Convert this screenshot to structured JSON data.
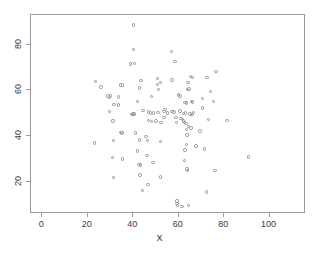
{
  "chart_data": {
    "type": "scatter",
    "title": "",
    "xlabel": "X",
    "ylabel": "",
    "xlim": [
      -5,
      116
    ],
    "ylim": [
      6,
      93
    ],
    "grid": false,
    "legend": null,
    "marker": {
      "shape": "open-circle",
      "color": "#8e8e94",
      "size": 3
    },
    "xticks": [
      0,
      20,
      40,
      60,
      80,
      100
    ],
    "yticks": [
      20,
      40,
      60,
      80
    ],
    "xtick_labels": [
      "0",
      "20",
      "40",
      "60",
      "80",
      "100"
    ],
    "ytick_labels": [
      "20",
      "40",
      "60",
      "80"
    ],
    "n_points": 118,
    "points": [
      [
        40.2,
        88.6
      ],
      [
        40.0,
        78.0
      ],
      [
        56.8,
        77.0
      ],
      [
        58.4,
        72.8
      ],
      [
        38.8,
        71.6
      ],
      [
        40.6,
        71.8
      ],
      [
        76.4,
        68.4
      ],
      [
        23.4,
        63.8
      ],
      [
        43.4,
        64.4
      ],
      [
        50.6,
        65.2
      ],
      [
        57.0,
        64.6
      ],
      [
        65.2,
        66.0
      ],
      [
        66.0,
        65.6
      ],
      [
        72.4,
        65.8
      ],
      [
        52.0,
        63.4
      ],
      [
        64.0,
        63.6
      ],
      [
        25.8,
        61.6
      ],
      [
        34.4,
        62.4
      ],
      [
        35.2,
        62.4
      ],
      [
        42.8,
        61.0
      ],
      [
        50.6,
        62.6
      ],
      [
        51.0,
        60.4
      ],
      [
        28.8,
        57.6
      ],
      [
        29.6,
        56.8
      ],
      [
        30.0,
        57.6
      ],
      [
        33.6,
        57.2
      ],
      [
        48.0,
        57.4
      ],
      [
        60.0,
        58.0
      ],
      [
        60.6,
        57.6
      ],
      [
        63.8,
        60.4
      ],
      [
        64.6,
        60.6
      ],
      [
        74.0,
        59.6
      ],
      [
        41.8,
        55.2
      ],
      [
        31.6,
        54.0
      ],
      [
        33.4,
        53.6
      ],
      [
        65.6,
        55.2
      ],
      [
        66.0,
        55.0
      ],
      [
        70.4,
        56.4
      ],
      [
        75.4,
        55.2
      ],
      [
        29.6,
        50.8
      ],
      [
        39.8,
        49.8
      ],
      [
        40.4,
        49.8
      ],
      [
        44.2,
        51.2
      ],
      [
        46.6,
        50.6
      ],
      [
        47.6,
        50.2
      ],
      [
        49.0,
        50.2
      ],
      [
        50.8,
        50.4
      ],
      [
        54.0,
        51.6
      ],
      [
        55.0,
        50.2
      ],
      [
        60.6,
        51.0
      ],
      [
        62.2,
        50.0
      ],
      [
        63.0,
        50.2
      ],
      [
        65.0,
        49.8
      ],
      [
        65.8,
        49.6
      ],
      [
        66.4,
        50.4
      ],
      [
        70.4,
        52.4
      ],
      [
        31.0,
        46.6
      ],
      [
        46.6,
        47.0
      ],
      [
        48.0,
        46.4
      ],
      [
        50.0,
        46.6
      ],
      [
        52.2,
        46.0
      ],
      [
        53.6,
        48.2
      ],
      [
        58.8,
        48.2
      ],
      [
        61.0,
        47.8
      ],
      [
        61.6,
        47.4
      ],
      [
        62.0,
        46.6
      ],
      [
        62.6,
        46.0
      ],
      [
        63.2,
        45.6
      ],
      [
        64.2,
        44.2
      ],
      [
        63.4,
        43.0
      ],
      [
        65.4,
        43.6
      ],
      [
        73.2,
        47.4
      ],
      [
        81.2,
        47.0
      ],
      [
        34.6,
        41.6
      ],
      [
        35.0,
        41.4
      ],
      [
        41.0,
        41.4
      ],
      [
        45.6,
        40.0
      ],
      [
        63.6,
        40.6
      ],
      [
        69.4,
        42.2
      ],
      [
        23.0,
        37.0
      ],
      [
        31.4,
        38.2
      ],
      [
        42.8,
        38.4
      ],
      [
        46.2,
        38.2
      ],
      [
        52.0,
        37.8
      ],
      [
        63.4,
        36.4
      ],
      [
        67.6,
        35.8
      ],
      [
        41.8,
        33.6
      ],
      [
        62.8,
        34.0
      ],
      [
        71.4,
        34.4
      ],
      [
        30.8,
        30.6
      ],
      [
        35.2,
        30.0
      ],
      [
        46.0,
        31.6
      ],
      [
        90.6,
        31.0
      ],
      [
        42.6,
        27.6
      ],
      [
        43.2,
        27.4
      ],
      [
        48.6,
        28.4
      ],
      [
        62.6,
        29.4
      ],
      [
        63.6,
        25.6
      ],
      [
        63.8,
        25.0
      ],
      [
        76.0,
        25.0
      ],
      [
        31.2,
        22.0
      ],
      [
        43.0,
        23.0
      ],
      [
        52.0,
        22.2
      ],
      [
        46.4,
        19.0
      ],
      [
        44.0,
        16.4
      ],
      [
        72.2,
        15.6
      ],
      [
        59.2,
        11.6
      ],
      [
        59.2,
        10.6
      ],
      [
        59.4,
        9.6
      ],
      [
        61.4,
        9.4
      ],
      [
        64.2,
        9.6
      ],
      [
        53.6,
        50.8
      ],
      [
        57.0,
        50.8
      ],
      [
        58.0,
        50.6
      ],
      [
        59.0,
        46.0
      ],
      [
        62.8,
        54.8
      ],
      [
        63.4,
        54.6
      ],
      [
        39.4,
        49.6
      ]
    ]
  },
  "axis": {
    "xlabel": "X",
    "xtick_labels": [
      "0",
      "20",
      "40",
      "60",
      "80",
      "100"
    ],
    "ytick_labels": [
      "20",
      "40",
      "60",
      "80"
    ]
  }
}
